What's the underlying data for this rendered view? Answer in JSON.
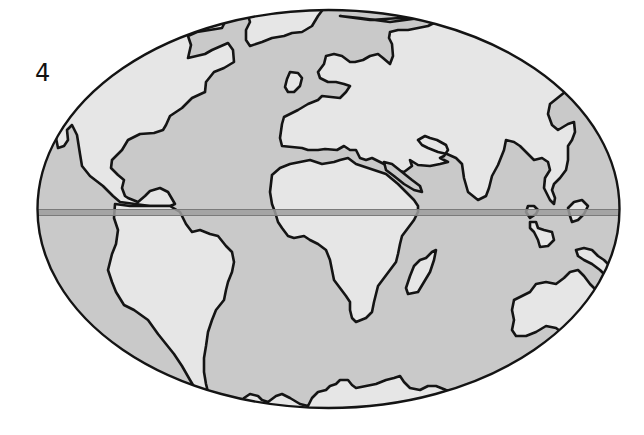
{
  "figure": {
    "label": "4",
    "type": "world-map-outline",
    "projection": "elliptical",
    "equator_line": true
  },
  "colors": {
    "ocean": "#c9c9c9",
    "land": "#e6e6e6",
    "outline": "#141414",
    "equator": "#9e9e9e",
    "background": "#ffffff"
  },
  "regions": [
    {
      "name": "North America"
    },
    {
      "name": "Greenland"
    },
    {
      "name": "South America"
    },
    {
      "name": "Europe"
    },
    {
      "name": "Africa"
    },
    {
      "name": "Madagascar"
    },
    {
      "name": "Asia"
    },
    {
      "name": "Southeast Asian Islands"
    },
    {
      "name": "Australia"
    },
    {
      "name": "Antarctica"
    }
  ]
}
